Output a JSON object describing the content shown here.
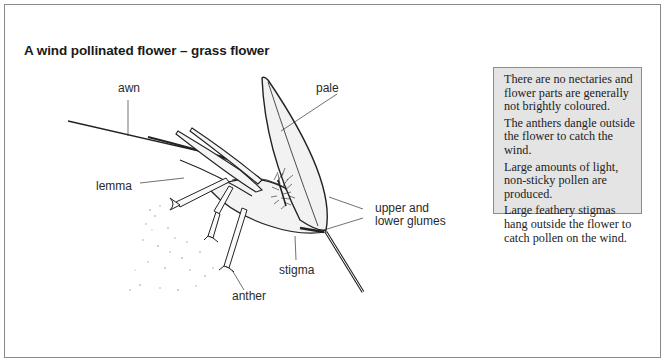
{
  "figure": {
    "title": "A wind pollinated flower – grass flower",
    "labels": {
      "awn": "awn",
      "pale": "pale",
      "lemma": "lemma",
      "glumes_line1": "upper and",
      "glumes_line2": "lower glumes",
      "stigma": "stigma",
      "anther": "anther"
    },
    "info_box": [
      "There are no nectaries and flower parts are generally not brightly coloured.",
      "The anthers dangle outside the flower to catch the wind.",
      "Large amounts of light, non-sticky pollen are produced.",
      "Large feathery stigmas hang outside the flower to catch pollen on the wind."
    ],
    "colors": {
      "frame_border": "#8a8a8a",
      "info_background": "#e4e4e4",
      "ink": "#222222"
    }
  }
}
